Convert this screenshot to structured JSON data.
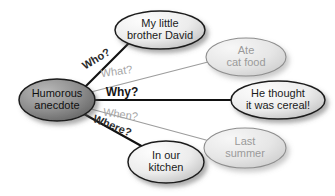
{
  "diagram": {
    "type": "concept-map",
    "background_color": "#ffffff",
    "center": {
      "id": "center",
      "label_line1": "Humorous",
      "label_line2": "anecdote",
      "cx": 57,
      "cy": 100,
      "rx": 38,
      "ry": 21,
      "fill_light": "#b9b9b9",
      "fill_dark": "#6e6e6e",
      "stroke": "#1a1a1a",
      "text_color": "#101010",
      "font_size": 11,
      "emphasis": "strong"
    },
    "nodes": [
      {
        "id": "who-node",
        "name": "my-little-brother-david",
        "label_line1": "My little",
        "label_line2": "brother David",
        "cx": 160,
        "cy": 30,
        "rx": 45,
        "ry": 19,
        "fill_light": "#fbfbfb",
        "fill_dark": "#c6c6c6",
        "stroke": "#1d1d1d",
        "text_color": "#1a1a1a",
        "font_size": 11,
        "emphasis": "strong"
      },
      {
        "id": "what-node",
        "name": "ate-cat-food",
        "label_line1": "Ate",
        "label_line2": "cat food",
        "cx": 246,
        "cy": 57,
        "rx": 40,
        "ry": 19,
        "fill_light": "#f4f4f4",
        "fill_dark": "#d2d2d2",
        "stroke": "#8e8e8e",
        "text_color": "#9a9a9a",
        "font_size": 11,
        "emphasis": "faded"
      },
      {
        "id": "why-node",
        "name": "he-thought-it-was-cereal",
        "label_line1": "He thought",
        "label_line2": "it was cereal!",
        "cx": 278,
        "cy": 100,
        "rx": 47,
        "ry": 19,
        "fill_light": "#fbfbfb",
        "fill_dark": "#c6c6c6",
        "stroke": "#1d1d1d",
        "text_color": "#1a1a1a",
        "font_size": 11,
        "emphasis": "strong"
      },
      {
        "id": "when-node",
        "name": "last-summer",
        "label_line1": "Last",
        "label_line2": "summer",
        "cx": 245,
        "cy": 148,
        "rx": 41,
        "ry": 20,
        "fill_light": "#f4f4f4",
        "fill_dark": "#d2d2d2",
        "stroke": "#8e8e8e",
        "text_color": "#9a9a9a",
        "font_size": 11,
        "emphasis": "faded"
      },
      {
        "id": "where-node",
        "name": "in-our-kitchen",
        "label_line1": "In our",
        "label_line2": "kitchen",
        "cx": 166,
        "cy": 162,
        "rx": 38,
        "ry": 21,
        "fill_light": "#fbfbfb",
        "fill_dark": "#c6c6c6",
        "stroke": "#1d1d1d",
        "text_color": "#1a1a1a",
        "font_size": 11,
        "emphasis": "strong"
      }
    ],
    "edges": [
      {
        "id": "edge-who",
        "name": "edge-who",
        "label": "Who?",
        "from": "center",
        "to": "who-node",
        "x1": 84,
        "y1": 88,
        "x2": 128,
        "y2": 44,
        "stroke": "#111111",
        "stroke_width": 2.1,
        "label_x": 98,
        "label_y": 62,
        "label_rotate": -31,
        "label_color": "#2b2b2b",
        "label_size": 11,
        "label_weight": "bold",
        "emphasis": "strong"
      },
      {
        "id": "edge-what",
        "name": "edge-what",
        "label": "What?",
        "from": "center",
        "to": "what-node",
        "x1": 91,
        "y1": 92,
        "x2": 208,
        "y2": 62,
        "stroke": "#9d9d9d",
        "stroke_width": 1.2,
        "label_x": 117,
        "label_y": 75,
        "label_rotate": -8,
        "label_color": "#a5a5a5",
        "label_size": 11,
        "label_weight": "normal",
        "emphasis": "faded"
      },
      {
        "id": "edge-why",
        "name": "edge-why",
        "label": "Why?",
        "from": "center",
        "to": "why-node",
        "x1": 94,
        "y1": 100,
        "x2": 231,
        "y2": 100,
        "stroke": "#111111",
        "stroke_width": 2.1,
        "label_x": 122,
        "label_y": 96,
        "label_rotate": 0,
        "label_color": "#151515",
        "label_size": 12,
        "label_weight": "bold",
        "emphasis": "strong"
      },
      {
        "id": "edge-when",
        "name": "edge-when",
        "label": "When?",
        "from": "center",
        "to": "when-node",
        "x1": 91,
        "y1": 109,
        "x2": 206,
        "y2": 140,
        "stroke": "#9d9d9d",
        "stroke_width": 1.2,
        "label_x": 120,
        "label_y": 118,
        "label_rotate": 8,
        "label_color": "#a5a5a5",
        "label_size": 11,
        "label_weight": "normal",
        "emphasis": "faded"
      },
      {
        "id": "edge-where",
        "name": "edge-where",
        "label": "Where?",
        "from": "center",
        "to": "where-node",
        "x1": 84,
        "y1": 114,
        "x2": 145,
        "y2": 148,
        "stroke": "#111111",
        "stroke_width": 2.1,
        "label_x": 111,
        "label_y": 129,
        "label_rotate": 22,
        "label_color": "#2b2b2b",
        "label_size": 11,
        "label_weight": "bold",
        "emphasis": "strong"
      }
    ]
  }
}
